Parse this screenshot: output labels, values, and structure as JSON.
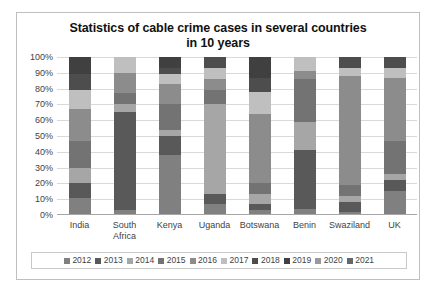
{
  "chart_data": {
    "type": "bar",
    "subtype": "stacked-percentage-column",
    "title": "Statistics of cable crime cases in several countries in 10 years",
    "title_lines": [
      "Statistics of cable crime cases in several countries",
      "in 10 years"
    ],
    "xlabel": "",
    "ylabel": "",
    "ylim": [
      0,
      100
    ],
    "ytick_labels": [
      "100%",
      "90%",
      "80%",
      "70%",
      "60%",
      "50%",
      "40%",
      "30%",
      "20%",
      "10%",
      "0%"
    ],
    "ytick_values": [
      100,
      90,
      80,
      70,
      60,
      50,
      40,
      30,
      20,
      10,
      0
    ],
    "grid": true,
    "legend_position": "bottom",
    "categories": [
      "India",
      "South Africa",
      "Kenya",
      "Uganda",
      "Botswana",
      "Benin",
      "Swaziland",
      "UK"
    ],
    "category_label_lines": [
      [
        "India"
      ],
      [
        "South",
        "Africa"
      ],
      [
        "Kenya"
      ],
      [
        "Uganda"
      ],
      [
        "Botswana"
      ],
      [
        "Benin"
      ],
      [
        "Swaziland"
      ],
      [
        "UK"
      ]
    ],
    "series": [
      {
        "name": "2012",
        "color": "#808080",
        "values": [
          11,
          3,
          38,
          7,
          3,
          4,
          2,
          15
        ]
      },
      {
        "name": "2013",
        "color": "#595959",
        "values": [
          9,
          62,
          12,
          6,
          4,
          37,
          6,
          7
        ]
      },
      {
        "name": "2014",
        "color": "#a6a6a6",
        "values": [
          10,
          5,
          4,
          57,
          6,
          18,
          4,
          4
        ]
      },
      {
        "name": "2015",
        "color": "#737373",
        "values": [
          17,
          7,
          16,
          9,
          7,
          27,
          7,
          21
        ]
      },
      {
        "name": "2016",
        "color": "#8c8c8c",
        "values": [
          20,
          13,
          13,
          7,
          44,
          5,
          69,
          40
        ]
      },
      {
        "name": "2017",
        "color": "#bfbfbf",
        "values": [
          12,
          10,
          6,
          7,
          14,
          9,
          5,
          6
        ]
      },
      {
        "name": "2018",
        "color": "#4d4d4d",
        "values": [
          10,
          0,
          4,
          7,
          9,
          0,
          7,
          7
        ]
      },
      {
        "name": "2019",
        "color": "#404040",
        "values": [
          11,
          0,
          7,
          0,
          13,
          0,
          0,
          0
        ]
      },
      {
        "name": "2020",
        "color": "#999999",
        "values": [
          0,
          0,
          0,
          0,
          0,
          0,
          0,
          0
        ]
      },
      {
        "name": "2021",
        "color": "#666666",
        "values": [
          0,
          0,
          0,
          0,
          0,
          0,
          0,
          0
        ]
      }
    ]
  },
  "legend": {
    "items": [
      {
        "label": "2012",
        "color": "#808080"
      },
      {
        "label": "2013",
        "color": "#595959"
      },
      {
        "label": "2014",
        "color": "#a6a6a6"
      },
      {
        "label": "2015",
        "color": "#737373"
      },
      {
        "label": "2016",
        "color": "#8c8c8c"
      },
      {
        "label": "2017",
        "color": "#bfbfbf"
      },
      {
        "label": "2018",
        "color": "#4d4d4d"
      },
      {
        "label": "2019",
        "color": "#404040"
      },
      {
        "label": "2020",
        "color": "#999999"
      },
      {
        "label": "2021",
        "color": "#666666"
      }
    ]
  }
}
